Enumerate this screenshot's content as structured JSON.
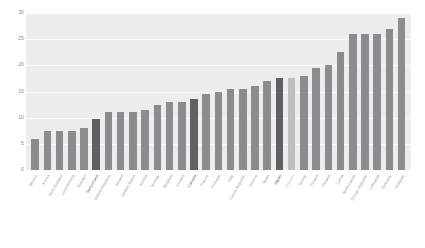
{
  "chart_data": {
    "type": "bar",
    "title": "",
    "subtitle": "",
    "xlabel": "",
    "ylabel": "",
    "ylim": [
      0,
      30
    ],
    "yticks": [
      0,
      5,
      10,
      15,
      20,
      25,
      30
    ],
    "ytick_labels": [
      "0",
      "5",
      "10",
      "15",
      "20",
      "25",
      "30"
    ],
    "grid": true,
    "legend": "none",
    "orientation": "vertical",
    "sorted": "ascending",
    "bar_color": "#8a8d8f",
    "highlight_dark_color": "#5e6163",
    "highlight_light_color": "#bdc0c1",
    "plot_background": "#eceded",
    "gridline_color": "#fbfbfb",
    "categories": [
      "Mexico",
      "Korea",
      "New Zealand",
      "Luxembourg",
      "Sweden",
      "Switzerland",
      "United Kingdom",
      "Ireland",
      "United States",
      "Austria",
      "Norway",
      "Belgium",
      "Iceland",
      "Canada",
      "France",
      "Portugal",
      "Italy",
      "Czech Republic",
      "Greece",
      "Spain",
      "Japan",
      "Estonia",
      "Turkey",
      "Poland",
      "Finland",
      "Latvia",
      "Netherlands",
      "Slovak Republic",
      "Lithuania",
      "Germany",
      "Hungary"
    ],
    "values": [
      6,
      7.5,
      7.5,
      7.5,
      8,
      9.8,
      11,
      11,
      11,
      11.5,
      12.5,
      13,
      13,
      13.5,
      14.5,
      15,
      15.5,
      15.5,
      16,
      17,
      17.5,
      17.5,
      18,
      19.5,
      20,
      22.5,
      26,
      26,
      26,
      27,
      29
    ],
    "highlights": {
      "dark": [
        "Switzerland",
        "Canada",
        "Japan"
      ],
      "light": [
        "Estonia"
      ]
    }
  }
}
